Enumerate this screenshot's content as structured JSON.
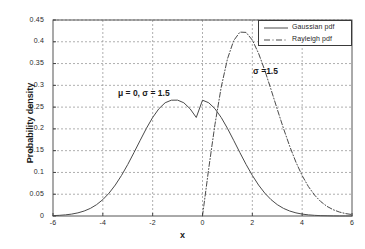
{
  "chart_data": {
    "type": "line",
    "title": "",
    "xlabel": "x",
    "ylabel": "Probability density",
    "xlim": [
      -6,
      6
    ],
    "ylim": [
      0,
      0.45
    ],
    "grid": true,
    "xticks": [
      "-6",
      "-4",
      "-2",
      "0",
      "2",
      "4",
      "6"
    ],
    "xtick_values": [
      -6,
      -4,
      -2,
      0,
      2,
      4,
      6
    ],
    "yticks": [
      "0",
      "0.05",
      "0.1",
      "0.15",
      "0.2",
      "0.25",
      "0.3",
      "0.35",
      "0.4",
      "0.45"
    ],
    "ytick_values": [
      0,
      0.05,
      0.1,
      0.15,
      0.2,
      0.25,
      0.3,
      0.35,
      0.4,
      0.45
    ],
    "legend_position": "top-right",
    "series": [
      {
        "name": "Gaussian pdf",
        "style": "solid",
        "color": "#4a4a4a",
        "params": {
          "mu": 0,
          "sigma": 1.5
        },
        "x": [
          -6,
          -5.75,
          -5.5,
          -5.25,
          -5,
          -4.75,
          -4.5,
          -4.25,
          -4,
          -3.75,
          -3.5,
          -3.25,
          -3,
          -2.75,
          -2.5,
          -2.25,
          -2,
          -1.75,
          -1.5,
          -1.25,
          -1,
          -0.75,
          -0.5,
          -0.25,
          0,
          0.25,
          0.5,
          0.75,
          1,
          1.25,
          1.5,
          1.75,
          2,
          2.25,
          2.5,
          2.75,
          3,
          3.25,
          3.5,
          3.75,
          4,
          4.25,
          4.5,
          4.75,
          5,
          5.25,
          5.5,
          5.75,
          6
        ],
        "values": [
          0.0008,
          0.0015,
          0.0026,
          0.0044,
          0.0072,
          0.0114,
          0.0175,
          0.0261,
          0.0376,
          0.0525,
          0.0711,
          0.0932,
          0.1183,
          0.1456,
          0.1738,
          0.2014,
          0.2262,
          0.2463,
          0.26,
          0.2659,
          0.266,
          0.26,
          0.2463,
          0.2262,
          0.2659,
          0.26,
          0.2463,
          0.2262,
          0.2014,
          0.1738,
          0.1456,
          0.1183,
          0.0932,
          0.0711,
          0.0525,
          0.0376,
          0.0261,
          0.0175,
          0.0114,
          0.0072,
          0.0044,
          0.0026,
          0.0015,
          0.0008,
          0.0005,
          0.0002,
          0.0001,
          0.0001,
          0.0
        ]
      },
      {
        "name": "Rayleigh pdf",
        "style": "dash-dot",
        "color": "#4a4a4a",
        "params": {
          "sigma": 1.5
        },
        "x": [
          0,
          0.25,
          0.5,
          0.75,
          1,
          1.25,
          1.5,
          1.75,
          2,
          2.25,
          2.5,
          2.75,
          3,
          3.25,
          3.5,
          3.75,
          4,
          4.25,
          4.5,
          4.75,
          5,
          5.25,
          5.5,
          5.75,
          6
        ],
        "values": [
          0.0,
          0.1092,
          0.2102,
          0.2955,
          0.3604,
          0.4025,
          0.4222,
          0.4215,
          0.4039,
          0.3735,
          0.3344,
          0.2905,
          0.2452,
          0.2011,
          0.1601,
          0.1236,
          0.0927,
          0.0676,
          0.0478,
          0.0329,
          0.022,
          0.0143,
          0.009,
          0.0055,
          0.0033
        ]
      }
    ],
    "annotations": [
      {
        "text": "μ = 0, σ = 1.5",
        "x": -1.4,
        "y": 0.287
      },
      {
        "text": "σ =1.5",
        "x": 2.1,
        "y": 0.323
      }
    ]
  },
  "legend": {
    "entries": [
      {
        "label": "Gaussian pdf"
      },
      {
        "label": "Rayleigh pdf"
      }
    ]
  },
  "axes": {
    "x_axis_label": "x",
    "y_axis_label": "Probability density"
  }
}
